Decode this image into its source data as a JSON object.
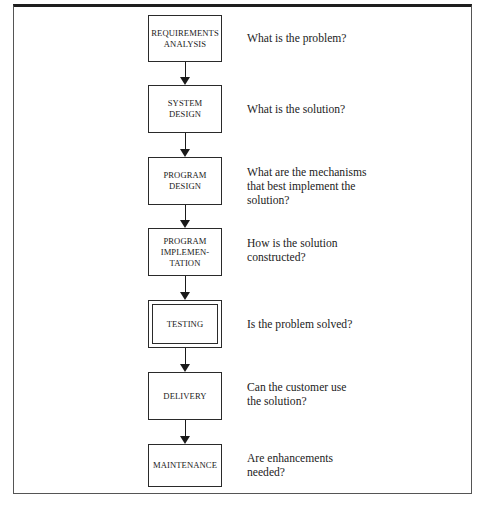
{
  "diagram": {
    "type": "waterfall-lifecycle-flowchart",
    "steps": [
      {
        "label": "REQUIREMENTS\nANALYSIS",
        "question": "What is the problem?",
        "emphasized": false
      },
      {
        "label": "SYSTEM\nDESIGN",
        "question": "What is the solution?",
        "emphasized": false
      },
      {
        "label": "PROGRAM\nDESIGN",
        "question": "What are the mechanisms\nthat best implement the\nsolution?",
        "emphasized": false
      },
      {
        "label": "PROGRAM\nIMPLEMEN-\nTATION",
        "question": "How is the solution\nconstructed?",
        "emphasized": false
      },
      {
        "label": "TESTING",
        "question": "Is the problem solved?",
        "emphasized": true
      },
      {
        "label": "DELIVERY",
        "question": "Can the customer use\nthe solution?",
        "emphasized": false
      },
      {
        "label": "MAINTENANCE",
        "question": "Are enhancements\nneeded?",
        "emphasized": false
      }
    ],
    "arrows": [
      {
        "from": 0,
        "to": 1
      },
      {
        "from": 1,
        "to": 2
      },
      {
        "from": 2,
        "to": 3
      },
      {
        "from": 3,
        "to": 4
      },
      {
        "from": 4,
        "to": 5
      },
      {
        "from": 5,
        "to": 6
      }
    ]
  }
}
